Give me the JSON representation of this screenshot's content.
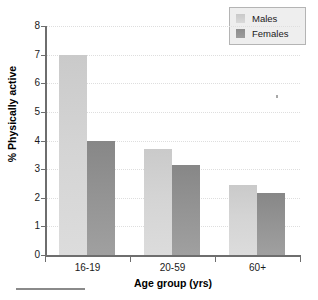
{
  "chart_data": {
    "type": "bar",
    "title": "",
    "xlabel": "Age group (yrs)",
    "ylabel": "% Physically active",
    "categories": [
      "16-19",
      "20-59",
      "60+"
    ],
    "series": [
      {
        "name": "Males",
        "values": [
          7.0,
          3.7,
          2.45
        ],
        "color": "#d4d4d4"
      },
      {
        "name": "Females",
        "values": [
          4.0,
          3.15,
          2.15
        ],
        "color": "#949494"
      }
    ],
    "ylim": [
      0,
      8
    ],
    "yticks": [
      0,
      1,
      2,
      3,
      4,
      5,
      6,
      7,
      8
    ],
    "ytick_labels": [
      "0",
      "1",
      "2",
      "3",
      "4",
      "5",
      "6",
      "7",
      "8"
    ],
    "grid": true,
    "grid_axis": "y",
    "legend_position": "top-right"
  },
  "legend": {
    "entries": [
      {
        "label": "Males"
      },
      {
        "label": "Females"
      }
    ]
  },
  "axes": {
    "x_title": "Age group (yrs)",
    "y_title": "% Physically active"
  }
}
